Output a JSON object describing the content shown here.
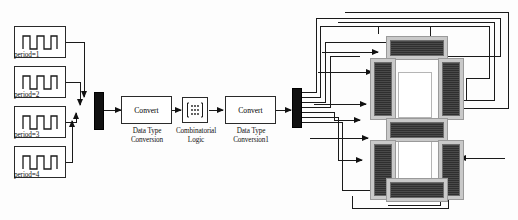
{
  "diagram": {
    "background": "#fdfdfd",
    "line_color": "#1a1a1a",
    "block_border": "#2a2a2a",
    "segment_fill": "#3a3a3a",
    "segment_frame": "#c9c9c9"
  },
  "sources": [
    {
      "label": "period=1",
      "icon": "square-wave-icon",
      "x": 14,
      "y": 26
    },
    {
      "label": "period=2",
      "icon": "square-wave-icon",
      "x": 14,
      "y": 66
    },
    {
      "label": "period=3",
      "icon": "square-wave-icon",
      "x": 14,
      "y": 106
    },
    {
      "label": "period=4",
      "icon": "square-wave-icon",
      "x": 14,
      "y": 146
    }
  ],
  "mux": {
    "name": "Mux",
    "inputs": 4,
    "outputs": 1
  },
  "demux": {
    "name": "Demux",
    "inputs": 1,
    "outputs": 7
  },
  "blocks": {
    "convert1": {
      "body": "Convert",
      "caption": "Data Type\nConversion"
    },
    "logic": {
      "icon": "truth-table-icon",
      "caption": "Combinatorial\nLogic"
    },
    "convert2": {
      "body": "Convert",
      "caption": "Data Type\nConversion1"
    }
  },
  "display": {
    "name": "seven-segment-display",
    "digits": 2,
    "segments": [
      {
        "id": "a",
        "orientation": "horizontal",
        "digit": 1
      },
      {
        "id": "f",
        "orientation": "vertical",
        "digit": 1
      },
      {
        "id": "b",
        "orientation": "vertical",
        "digit": 1
      },
      {
        "id": "g",
        "orientation": "horizontal",
        "digit": 1
      },
      {
        "id": "e",
        "orientation": "vertical",
        "digit": 2
      },
      {
        "id": "c",
        "orientation": "vertical",
        "digit": 2
      },
      {
        "id": "d",
        "orientation": "horizontal",
        "digit": 2
      }
    ]
  }
}
